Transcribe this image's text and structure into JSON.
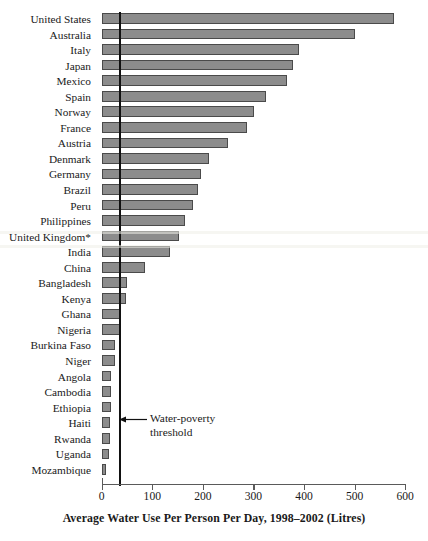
{
  "chart_data": {
    "type": "bar",
    "orientation": "horizontal",
    "title": "",
    "xlabel": "Average Water Use Per Person Per Day, 1998–2002 (Litres)",
    "ylabel": "",
    "xlim": [
      0,
      600
    ],
    "xticks": [
      0,
      100,
      200,
      300,
      400,
      500,
      600
    ],
    "xtick_labels": [
      "0",
      "100",
      "200",
      "300",
      "400",
      "500",
      "600"
    ],
    "grid": false,
    "legend": false,
    "bar_color": "#8c8c8c",
    "bar_edge_color": "#4a4a4a",
    "categories": [
      "United States",
      "Australia",
      "Italy",
      "Japan",
      "Mexico",
      "Spain",
      "Norway",
      "France",
      "Austria",
      "Denmark",
      "Germany",
      "Brazil",
      "Peru",
      "Philippines",
      "United Kingdom*",
      "India",
      "China",
      "Bangladesh",
      "Kenya",
      "Ghana",
      "Nigeria",
      "Burkina Faso",
      "Niger",
      "Angola",
      "Cambodia",
      "Ethiopia",
      "Haiti",
      "Rwanda",
      "Uganda",
      "Mozambique"
    ],
    "values": [
      578,
      500,
      390,
      378,
      366,
      325,
      301,
      287,
      250,
      212,
      196,
      190,
      180,
      165,
      153,
      135,
      86,
      50,
      49,
      36,
      36,
      27,
      26,
      19,
      19,
      18,
      17,
      16,
      15,
      8
    ],
    "annotations": [
      {
        "name": "water-poverty-threshold",
        "text_line1": "Water-poverty",
        "text_line2": "threshold",
        "value": 36,
        "marker": "vertical-line-with-arrow"
      }
    ]
  },
  "axis": {
    "x_title": "Average Water Use Per Person Per Day, 1998–2002 (Litres)"
  }
}
